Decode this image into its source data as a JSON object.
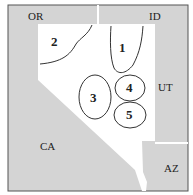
{
  "colors": {
    "neighbor_fill": "#d4d4d4",
    "nevada_fill": "#ffffff",
    "outline": "#333333"
  },
  "states": {
    "oregon": "OR",
    "idaho": "ID",
    "utah": "UT",
    "california": "CA",
    "arizona": "AZ"
  },
  "regions": [
    {
      "id": "1",
      "label": "1"
    },
    {
      "id": "2",
      "label": "2"
    },
    {
      "id": "3",
      "label": "3"
    },
    {
      "id": "4",
      "label": "4"
    },
    {
      "id": "5",
      "label": "5"
    }
  ]
}
